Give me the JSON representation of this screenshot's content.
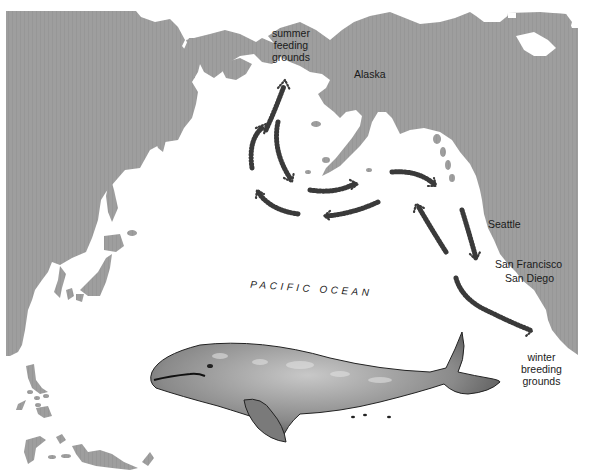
{
  "figure": {
    "colors": {
      "land": "#9d9d9d",
      "water": "#ffffff",
      "route_stipple": "#3a3a3a",
      "label_text": "#1a1a1a"
    }
  },
  "labels": {
    "summer_grounds": [
      "summer",
      "feeding",
      "grounds"
    ],
    "alaska": "Alaska",
    "seattle": "Seattle",
    "san_francisco": "San Francisco",
    "san_diego": "San Diego",
    "winter_grounds": [
      "winter",
      "breeding",
      "grounds"
    ],
    "ocean": "PACIFIC OCEAN"
  },
  "routes": [
    {
      "name": "route-bering-north",
      "direction": "north",
      "description": "Bering Sea up to summer feeding grounds"
    },
    {
      "name": "route-aleutian-west",
      "direction": "northeast",
      "description": "Western loop toward Bering Strait"
    },
    {
      "name": "route-aleutian-south",
      "direction": "south",
      "description": "Return south from Bering Sea"
    },
    {
      "name": "route-gulf-east",
      "direction": "east",
      "description": "Across Gulf of Alaska eastward"
    },
    {
      "name": "route-gulf-east-2",
      "direction": "east",
      "description": "Along Gulf of Alaska coast"
    },
    {
      "name": "route-mid-west",
      "direction": "west",
      "description": "Central Pacific westward"
    },
    {
      "name": "route-west-loop",
      "direction": "west",
      "description": "Western Pacific loop"
    },
    {
      "name": "route-coast-south",
      "direction": "south",
      "description": "Down Pacific coast past Seattle"
    },
    {
      "name": "route-coast-north",
      "direction": "north",
      "description": "North along coast"
    },
    {
      "name": "route-baja-south",
      "direction": "southeast",
      "description": "To winter breeding grounds"
    }
  ],
  "illustration": {
    "subject": "gray whale"
  }
}
